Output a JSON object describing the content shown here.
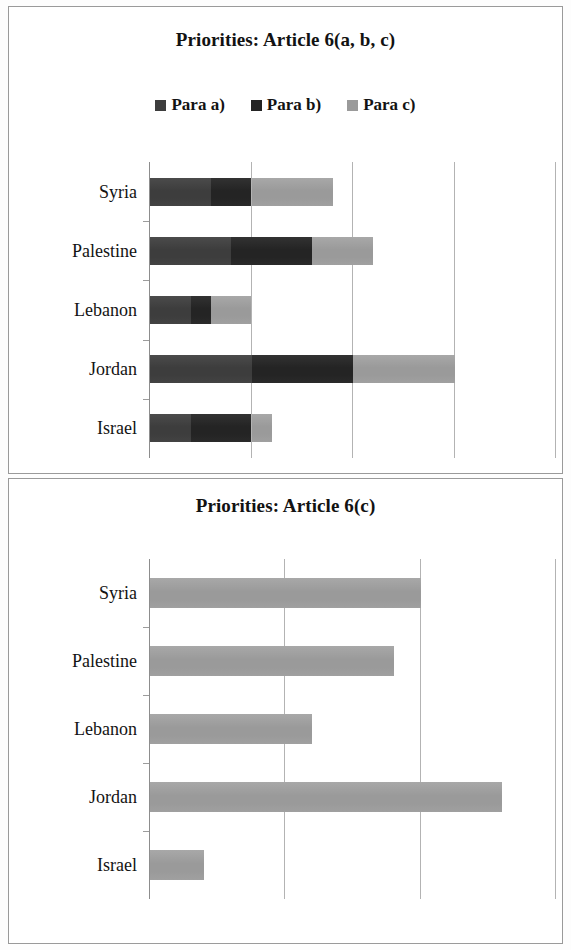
{
  "charts": [
    {
      "title": "Priorities: Article 6(a, b, c)",
      "legend": [
        {
          "label": "Para a)",
          "color": "#3d3d3d"
        },
        {
          "label": "Para b)",
          "color": "#242424"
        },
        {
          "label": "Para c)",
          "color": "#9a9a9a"
        }
      ]
    },
    {
      "title": "Priorities: Article 6(c)"
    }
  ],
  "chart_data": [
    {
      "type": "bar",
      "orientation": "horizontal",
      "stacked": true,
      "title": "Priorities: Article 6(a, b, c)",
      "xlabel": "",
      "ylabel": "",
      "categories": [
        "Israel",
        "Jordan",
        "Lebanon",
        "Palestine",
        "Syria"
      ],
      "category_order_top_to_bottom": [
        "Syria",
        "Palestine",
        "Lebanon",
        "Jordan",
        "Israel"
      ],
      "series": [
        {
          "name": "Para a)",
          "color": "#3d3d3d",
          "values": [
            2,
            5,
            2,
            4,
            3
          ]
        },
        {
          "name": "Para b)",
          "color": "#242424",
          "values": [
            3,
            5,
            1,
            4,
            2
          ]
        },
        {
          "name": "Para c)",
          "color": "#9a9a9a",
          "values": [
            1,
            5,
            2,
            3,
            4
          ]
        }
      ],
      "xlim": [
        0,
        20
      ],
      "xticks": [
        0,
        5,
        10,
        15,
        20
      ],
      "grid": true,
      "legend_position": "top"
    },
    {
      "type": "bar",
      "orientation": "horizontal",
      "stacked": false,
      "title": "Priorities: Article 6(c)",
      "xlabel": "",
      "ylabel": "",
      "categories": [
        "Israel",
        "Jordan",
        "Lebanon",
        "Palestine",
        "Syria"
      ],
      "category_order_top_to_bottom": [
        "Syria",
        "Palestine",
        "Lebanon",
        "Jordan",
        "Israel"
      ],
      "series": [
        {
          "name": "Para c)",
          "color": "#9a9a9a",
          "values": [
            2,
            13,
            6,
            9,
            10
          ]
        }
      ],
      "xlim": [
        0,
        15
      ],
      "xticks": [
        0,
        5,
        10,
        15
      ],
      "grid": true,
      "legend_position": "none"
    }
  ],
  "axis_labels": {
    "syria": "Syria",
    "palestine": "Palestine",
    "lebanon": "Lebanon",
    "jordan": "Jordan",
    "israel": "Israel"
  }
}
